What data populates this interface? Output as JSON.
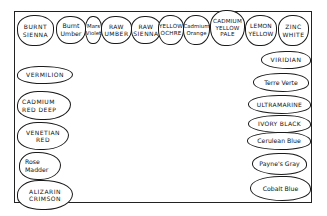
{
  "top_row": [
    {
      "lines": [
        "BURNT",
        "SIENNA"
      ],
      "case": "caps"
    },
    {
      "lines": [
        "Burnt",
        "Umber"
      ],
      "case": "mixed"
    },
    {
      "lines": [
        "Mars",
        "Violet"
      ],
      "case": "mixed"
    },
    {
      "lines": [
        "RAW",
        "UMBER"
      ],
      "case": "caps"
    },
    {
      "lines": [
        "RAW",
        "SIENNA"
      ],
      "case": "caps"
    },
    {
      "lines": [
        "YELLOW",
        "OCHRE"
      ],
      "case": "caps"
    },
    {
      "lines": [
        "Cadmium",
        "Orange"
      ],
      "case": "mixed"
    },
    {
      "lines": [
        "CADMIUM",
        "YELLOW",
        "PALE"
      ],
      "case": "caps"
    },
    {
      "lines": [
        "LEMON",
        "YELLOW"
      ],
      "case": "caps"
    },
    {
      "lines": [
        "ZINC",
        "WHITE"
      ],
      "case": "caps"
    }
  ],
  "left_column": [
    {
      "lines": [
        "VERMILION"
      ],
      "case": "caps"
    },
    {
      "lines": [
        "CADMIUM",
        "RED DEEP"
      ],
      "case": "caps"
    },
    {
      "lines": [
        "VENETIAN",
        "RED"
      ],
      "case": "caps"
    },
    {
      "lines": [
        "Rose",
        "Madder"
      ],
      "case": "mixed"
    },
    {
      "lines": [
        "ALIZARIN",
        "CRIMSON"
      ],
      "case": "caps"
    }
  ],
  "right_column": [
    {
      "lines": [
        "VIRIDIAN"
      ],
      "case": "caps"
    },
    {
      "lines": [
        "Terre Verte"
      ],
      "case": "mixed"
    },
    {
      "lines": [
        "ULTRAMARINE"
      ],
      "case": "caps"
    },
    {
      "lines": [
        "IVORY BLACK"
      ],
      "case": "caps"
    },
    {
      "lines": [
        "Cerulean Blue"
      ],
      "case": "mixed"
    },
    {
      "lines": [
        "Payne's Gray"
      ],
      "case": "mixed"
    },
    {
      "lines": [
        "Cobalt Blue"
      ],
      "case": "mixed"
    }
  ],
  "colors": {
    "ink": "#1a1a1a",
    "paper": "#ffffff"
  }
}
